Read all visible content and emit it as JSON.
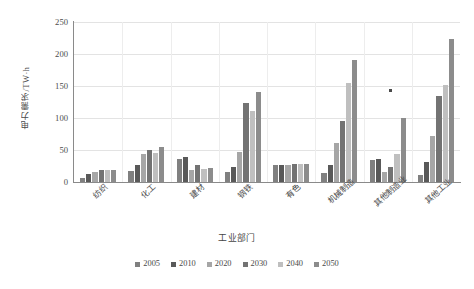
{
  "chart_data": {
    "type": "bar",
    "title": "",
    "xlabel": "工业部门",
    "ylabel": "电力需求/TW·h",
    "ylim": [
      0,
      250
    ],
    "yticks": [
      0,
      50,
      100,
      150,
      200,
      250
    ],
    "grid": true,
    "legend_position": "bottom",
    "categories": [
      "纺织",
      "化工",
      "建材",
      "钢铁",
      "有色",
      "机械制造",
      "其他制造业",
      "其他工业"
    ],
    "series": [
      {
        "name": "2005",
        "color": "#808080",
        "values": [
          7,
          17,
          36,
          16,
          26,
          14,
          34,
          11
        ]
      },
      {
        "name": "2010",
        "color": "#595959",
        "values": [
          13,
          27,
          39,
          23,
          27,
          27,
          36,
          31
        ]
      },
      {
        "name": "2020",
        "color": "#a6a6a6",
        "values": [
          16,
          43,
          18,
          47,
          27,
          61,
          15,
          72
        ]
      },
      {
        "name": "2030",
        "color": "#737373",
        "values": [
          19,
          50,
          26,
          124,
          28,
          95,
          23,
          134
        ]
      },
      {
        "name": "2040",
        "color": "#bfbfbf",
        "values": [
          19,
          46,
          20,
          111,
          28,
          155,
          43,
          151
        ]
      },
      {
        "name": "2050",
        "color": "#8c8c8c",
        "values": [
          19,
          55,
          22,
          140,
          28,
          190,
          100,
          224
        ]
      }
    ]
  },
  "axis": {
    "y_title": "电力需求/TW·h",
    "x_title": "工业部门",
    "y_tick_labels": [
      "0",
      "50",
      "100",
      "150",
      "200",
      "250"
    ],
    "x_tick_labels": [
      "纺织",
      "化工",
      "建材",
      "钢铁",
      "有色",
      "机械制造",
      "其他制造业",
      "其他工业"
    ]
  },
  "legend": {
    "items": [
      {
        "label": "2005",
        "color": "#808080"
      },
      {
        "label": "2010",
        "color": "#595959"
      },
      {
        "label": "2020",
        "color": "#a6a6a6"
      },
      {
        "label": "2030",
        "color": "#737373"
      },
      {
        "label": "2040",
        "color": "#bfbfbf"
      },
      {
        "label": "2050",
        "color": "#8c8c8c"
      }
    ]
  }
}
